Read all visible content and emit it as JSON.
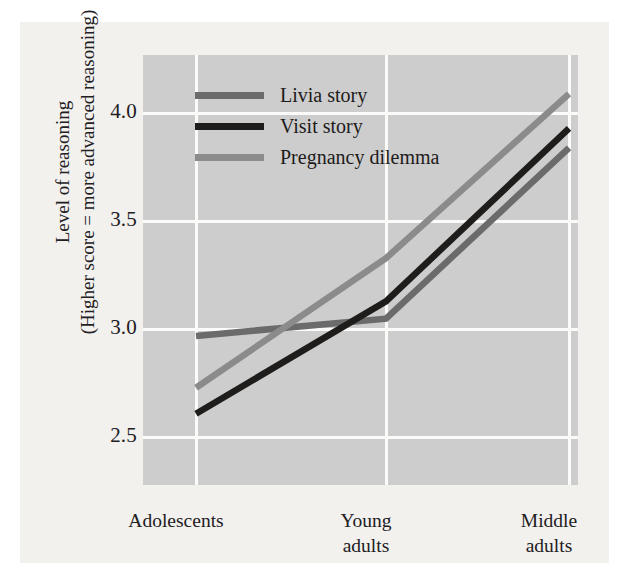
{
  "chart_data": {
    "type": "line",
    "title": "",
    "xlabel": "",
    "ylabel": "Level of reasoning (Higher score = more advanced reasoning)",
    "ylabel_lines": [
      "Level of reasoning",
      "(Higher score = more advanced reasoning)"
    ],
    "categories": [
      "Adolescents",
      "Young adults",
      "Middle adults"
    ],
    "category_lines": [
      [
        "Adolescents"
      ],
      [
        "Young",
        "adults"
      ],
      [
        "Middle",
        "adults"
      ]
    ],
    "ylim": [
      2.28,
      4.27
    ],
    "yticks": [
      4.0,
      3.5,
      3.0,
      2.5
    ],
    "ytick_labels": [
      "4.0",
      "3.5",
      "3.0",
      "2.5"
    ],
    "grid": true,
    "legend_position": "top-left-inside",
    "series": [
      {
        "name": "Livia story",
        "color": "#6b6b6b",
        "values": [
          2.97,
          3.05,
          3.84
        ]
      },
      {
        "name": "Visit story",
        "color": "#1f1d1b",
        "values": [
          2.61,
          3.13,
          3.93
        ]
      },
      {
        "name": "Pregnancy dilemma",
        "color": "#8b8b8b",
        "values": [
          2.73,
          3.33,
          4.09
        ]
      }
    ]
  },
  "colors": {
    "figure_background": "#f2f1ee",
    "plot_background": "#cdcdcd",
    "gridline": "#fbfbfa",
    "text": "#22201e"
  },
  "legend": {
    "items": [
      {
        "label": "Livia story",
        "color": "#6b6b6b"
      },
      {
        "label": "Visit story",
        "color": "#1f1d1b"
      },
      {
        "label": "Pregnancy dilemma",
        "color": "#8b8b8b"
      }
    ]
  }
}
